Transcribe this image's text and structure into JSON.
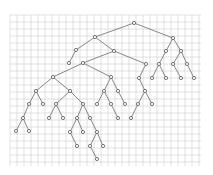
{
  "diagram": {
    "type": "binary-tree-on-grid",
    "background": "#ffffff",
    "grid": {
      "x0": 10,
      "y0": 15,
      "x1": 201,
      "y1": 166,
      "spacing": 7,
      "color": "#cfcfcf"
    },
    "colors": {
      "edge": "#6a6a6a",
      "node_stroke": "#555555",
      "node_fill": "#ffffff"
    },
    "node_radius": 1.6,
    "nodes": [
      {
        "id": 0,
        "x": 134,
        "y": 23
      },
      {
        "id": 1,
        "x": 95,
        "y": 37
      },
      {
        "id": 2,
        "x": 173,
        "y": 38
      },
      {
        "id": 3,
        "x": 76,
        "y": 50
      },
      {
        "id": 4,
        "x": 69,
        "y": 63
      },
      {
        "id": 5,
        "x": 114,
        "y": 51
      },
      {
        "id": 6,
        "x": 83,
        "y": 63
      },
      {
        "id": 7,
        "x": 146,
        "y": 64
      },
      {
        "id": 8,
        "x": 53,
        "y": 77
      },
      {
        "id": 9,
        "x": 111,
        "y": 77
      },
      {
        "id": 10,
        "x": 139,
        "y": 78
      },
      {
        "id": 11,
        "x": 36,
        "y": 91
      },
      {
        "id": 12,
        "x": 70,
        "y": 91
      },
      {
        "id": 13,
        "x": 29,
        "y": 104
      },
      {
        "id": 14,
        "x": 43,
        "y": 104
      },
      {
        "id": 15,
        "x": 23,
        "y": 118
      },
      {
        "id": 16,
        "x": 16,
        "y": 131
      },
      {
        "id": 17,
        "x": 29,
        "y": 131
      },
      {
        "id": 18,
        "x": 56,
        "y": 104
      },
      {
        "id": 19,
        "x": 83,
        "y": 104
      },
      {
        "id": 20,
        "x": 49,
        "y": 118
      },
      {
        "id": 21,
        "x": 63,
        "y": 118
      },
      {
        "id": 22,
        "x": 77,
        "y": 118
      },
      {
        "id": 23,
        "x": 90,
        "y": 118
      },
      {
        "id": 24,
        "x": 70,
        "y": 132
      },
      {
        "id": 25,
        "x": 83,
        "y": 132
      },
      {
        "id": 26,
        "x": 97,
        "y": 132
      },
      {
        "id": 27,
        "x": 77,
        "y": 146
      },
      {
        "id": 28,
        "x": 90,
        "y": 146
      },
      {
        "id": 29,
        "x": 103,
        "y": 146
      },
      {
        "id": 30,
        "x": 97,
        "y": 159
      },
      {
        "id": 31,
        "x": 104,
        "y": 91
      },
      {
        "id": 32,
        "x": 118,
        "y": 91
      },
      {
        "id": 33,
        "x": 97,
        "y": 104
      },
      {
        "id": 34,
        "x": 111,
        "y": 104
      },
      {
        "id": 35,
        "x": 125,
        "y": 104
      },
      {
        "id": 36,
        "x": 118,
        "y": 118
      },
      {
        "id": 37,
        "x": 145,
        "y": 91
      },
      {
        "id": 38,
        "x": 138,
        "y": 104
      },
      {
        "id": 39,
        "x": 152,
        "y": 104
      },
      {
        "id": 40,
        "x": 131,
        "y": 118
      },
      {
        "id": 41,
        "x": 166,
        "y": 51
      },
      {
        "id": 42,
        "x": 181,
        "y": 51
      },
      {
        "id": 43,
        "x": 159,
        "y": 64
      },
      {
        "id": 44,
        "x": 173,
        "y": 64
      },
      {
        "id": 45,
        "x": 187,
        "y": 64
      },
      {
        "id": 46,
        "x": 152,
        "y": 78
      },
      {
        "id": 47,
        "x": 166,
        "y": 78
      },
      {
        "id": 48,
        "x": 181,
        "y": 78
      },
      {
        "id": 49,
        "x": 194,
        "y": 78
      }
    ],
    "edges": [
      [
        0,
        1
      ],
      [
        0,
        2
      ],
      [
        1,
        3
      ],
      [
        3,
        4
      ],
      [
        1,
        5
      ],
      [
        5,
        6
      ],
      [
        5,
        7
      ],
      [
        6,
        8
      ],
      [
        6,
        9
      ],
      [
        7,
        10
      ],
      [
        8,
        11
      ],
      [
        8,
        12
      ],
      [
        11,
        13
      ],
      [
        11,
        14
      ],
      [
        13,
        15
      ],
      [
        15,
        16
      ],
      [
        15,
        17
      ],
      [
        12,
        18
      ],
      [
        12,
        19
      ],
      [
        18,
        20
      ],
      [
        18,
        21
      ],
      [
        19,
        22
      ],
      [
        19,
        23
      ],
      [
        22,
        24
      ],
      [
        22,
        25
      ],
      [
        24,
        27
      ],
      [
        23,
        26
      ],
      [
        26,
        28
      ],
      [
        26,
        29
      ],
      [
        28,
        30
      ],
      [
        9,
        31
      ],
      [
        9,
        32
      ],
      [
        31,
        33
      ],
      [
        31,
        34
      ],
      [
        34,
        36
      ],
      [
        32,
        35
      ],
      [
        10,
        37
      ],
      [
        37,
        38
      ],
      [
        37,
        39
      ],
      [
        38,
        40
      ],
      [
        2,
        41
      ],
      [
        2,
        42
      ],
      [
        41,
        43
      ],
      [
        43,
        46
      ],
      [
        43,
        47
      ],
      [
        42,
        44
      ],
      [
        42,
        45
      ],
      [
        44,
        48
      ],
      [
        45,
        49
      ]
    ]
  }
}
